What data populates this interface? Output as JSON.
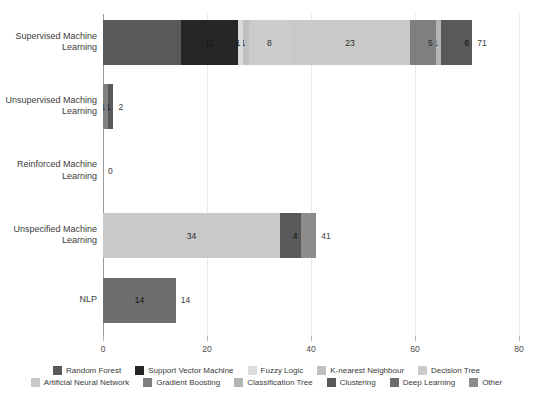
{
  "chart_data": {
    "type": "bar",
    "orientation": "horizontal",
    "stacked": true,
    "title": "",
    "xlabel": "",
    "ylabel": "",
    "xlim": [
      0,
      80
    ],
    "xticks": [
      0,
      20,
      40,
      60,
      80
    ],
    "grid": true,
    "legend_position": "bottom",
    "categories": [
      "Supervised Machine Learning",
      "Unsupervised Maching Learning",
      "Reinforced Machine Learning",
      "Unspecified Machine Learning",
      "NLP"
    ],
    "series": [
      {
        "name": "Random Forest",
        "color": "#595959",
        "values": [
          15,
          0,
          0,
          0,
          0
        ]
      },
      {
        "name": "Support Vector Machine",
        "color": "#262626",
        "values": [
          11,
          0,
          0,
          0,
          0
        ]
      },
      {
        "name": "Fuzzy Logic",
        "color": "#d9d9d9",
        "values": [
          1,
          0,
          0,
          0,
          0
        ]
      },
      {
        "name": "K-nearest Neighbour",
        "color": "#bfbfbf",
        "values": [
          1,
          0,
          0,
          0,
          0
        ]
      },
      {
        "name": "Decision Tree",
        "color": "#cccccc",
        "values": [
          8,
          0,
          0,
          0,
          0
        ]
      },
      {
        "name": "Artificial Neural Network",
        "color": "#c9c9c9",
        "values": [
          23,
          0,
          0,
          34,
          0
        ]
      },
      {
        "name": "Gradient Boosting",
        "color": "#7f7f7f",
        "values": [
          5,
          1,
          0,
          0,
          0
        ]
      },
      {
        "name": "Classification Tree",
        "color": "#b3b3b3",
        "values": [
          1,
          0,
          0,
          0,
          0
        ]
      },
      {
        "name": "Clustering",
        "color": "#595959",
        "values": [
          6,
          1,
          0,
          4,
          0
        ]
      },
      {
        "name": "Deep Learning",
        "color": "#6e6e6e",
        "values": [
          0,
          0,
          0,
          0,
          14
        ]
      },
      {
        "name": "Other",
        "color": "#8c8c8c",
        "values": [
          0,
          0,
          0,
          3,
          0
        ]
      }
    ],
    "totals": [
      71,
      2,
      0,
      41,
      14
    ],
    "segment_labels": [
      [
        {
          "label": "",
          "value": 15
        },
        {
          "label": "11",
          "value": 11
        },
        {
          "label": "1",
          "value": 1
        },
        {
          "label": "1",
          "value": 1
        },
        {
          "label": "8",
          "value": 8
        },
        {
          "label": "23",
          "value": 23
        },
        {
          "label": "5",
          "value": 5
        },
        {
          "label": "1",
          "value": 1
        },
        {
          "label": "6",
          "value": 6
        }
      ],
      [
        {
          "label": "1",
          "value": 1
        },
        {
          "label": "1",
          "value": 1
        }
      ],
      [],
      [
        {
          "label": "34",
          "value": 34
        },
        {
          "label": "4",
          "value": 4
        },
        {
          "label": "",
          "value": 3
        }
      ],
      [
        {
          "label": "14",
          "value": 14
        }
      ]
    ]
  },
  "axis": {
    "tick_labels": [
      "0",
      "20",
      "40",
      "60",
      "80"
    ]
  },
  "rows": [
    {
      "category_line1": "Supervised Machine",
      "category_line2": "Learning",
      "total_label": "71"
    },
    {
      "category_line1": "Unsupervised Maching",
      "category_line2": "Learning",
      "total_label": "2"
    },
    {
      "category_line1": "Reinforced Machine",
      "category_line2": "Learning",
      "total_label": "0"
    },
    {
      "category_line1": "Unspecified Machine",
      "category_line2": "Learning",
      "total_label": "41"
    },
    {
      "category_line1": "NLP",
      "category_line2": "",
      "total_label": "14"
    }
  ],
  "legend": {
    "row1": [
      {
        "label": "Random Forest",
        "color": "#595959"
      },
      {
        "label": "Support Vector Machine",
        "color": "#262626"
      },
      {
        "label": "Fuzzy Logic",
        "color": "#dcdcdc"
      },
      {
        "label": "K-nearest Neighbour",
        "color": "#bfbfbf"
      },
      {
        "label": "Decision Tree",
        "color": "#cccccc"
      }
    ],
    "row2": [
      {
        "label": "Artificial Neural Network",
        "color": "#c9c9c9"
      },
      {
        "label": "Gradient Boosting",
        "color": "#7f7f7f"
      },
      {
        "label": "Classification Tree",
        "color": "#b3b3b3"
      },
      {
        "label": "Clustering",
        "color": "#595959"
      },
      {
        "label": "Deep Learning",
        "color": "#6e6e6e"
      },
      {
        "label": "Other",
        "color": "#8c8c8c"
      }
    ]
  }
}
